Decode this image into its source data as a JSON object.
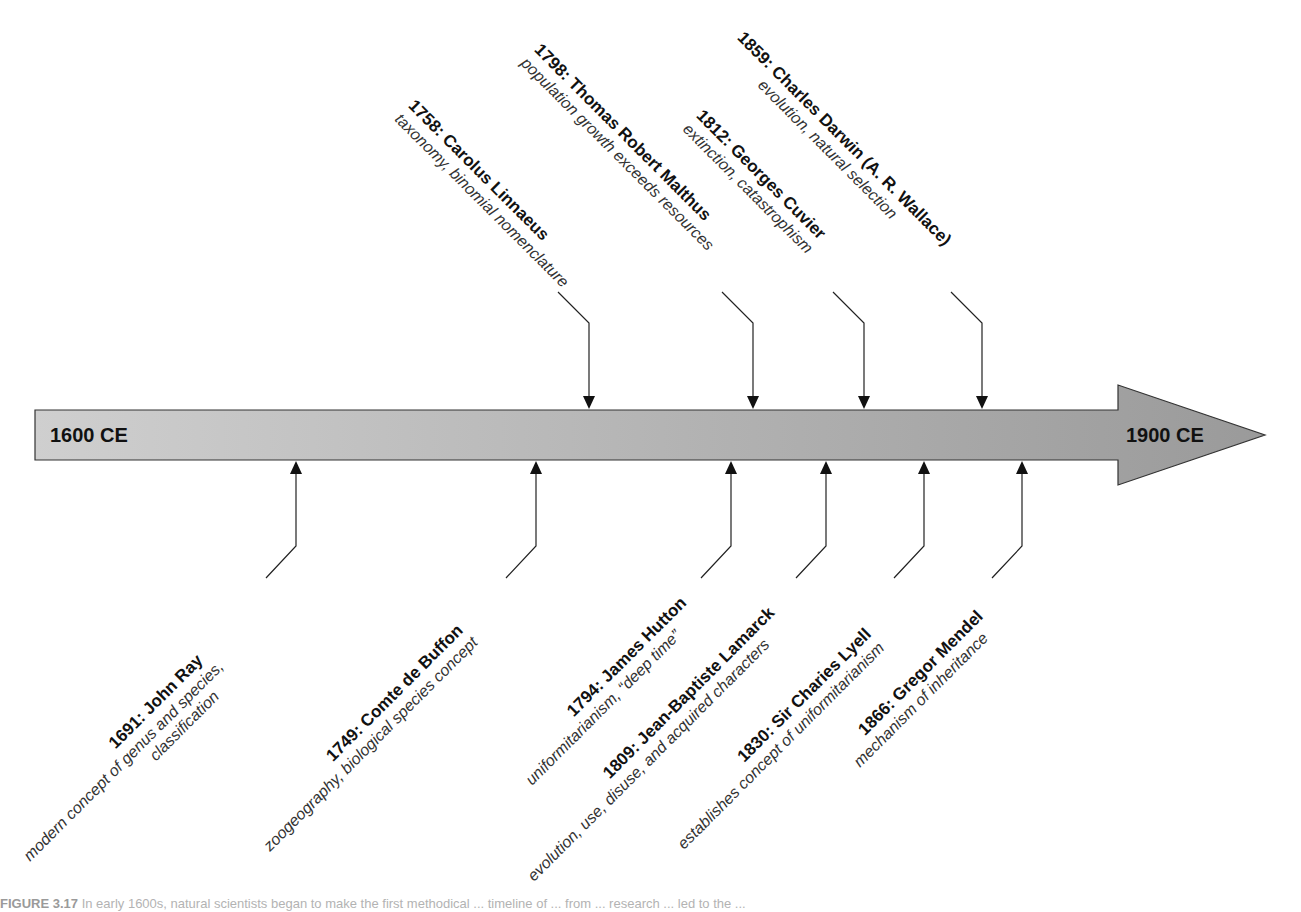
{
  "timeline": {
    "start_label": "1600 CE",
    "end_label": "1900 CE",
    "colors": {
      "bar_light": "#cfcfcf",
      "bar_dark": "#9a9a9a",
      "outline": "#333333",
      "leader": "#222222"
    }
  },
  "events_above": [
    {
      "year": "1758",
      "name": "1758: Carolus Linnaeus",
      "desc": "taxonomy, binomial nomenclature",
      "x": 589
    },
    {
      "year": "1798",
      "name": "1798: Thomas Robert Malthus",
      "desc": "population growth exceeds resources",
      "x": 753
    },
    {
      "year": "1812",
      "name": "1812: Georges Cuvier",
      "desc": "extinction, catastrophism",
      "x": 864
    },
    {
      "year": "1859",
      "name": "1859: Charles Darwin (A. R. Wallace)",
      "desc": "evolution, natural selection",
      "x": 982
    }
  ],
  "events_below": [
    {
      "year": "1691",
      "name": "1691: John Ray",
      "desc": "modern concept of genus and species,",
      "desc2": "classification",
      "x": 296
    },
    {
      "year": "1749",
      "name": "1749: Comte de Buffon",
      "desc": "zoogeography, biological species concept",
      "x": 536
    },
    {
      "year": "1794",
      "name": "1794: James Hutton",
      "desc": "uniformitarianism, “deep time”",
      "x": 731
    },
    {
      "year": "1809",
      "name": "1809: Jean-Baptiste Lamarck",
      "desc": "evolution, use, disuse, and acquired characters",
      "x": 826
    },
    {
      "year": "1830",
      "name": "1830: Sir Charies Lyell",
      "desc": "establishes concept of uniformitarianism",
      "x": 924
    },
    {
      "year": "1866",
      "name": "1866: Gregor Mendel",
      "desc": "mechanism of inheritance",
      "x": 1022
    }
  ],
  "caption": {
    "figure_label": "FIGURE 3.17",
    "text": "In early 1600s, natural scientists began to make the first methodical ... timeline of ... from ... research ... led to the ..."
  }
}
